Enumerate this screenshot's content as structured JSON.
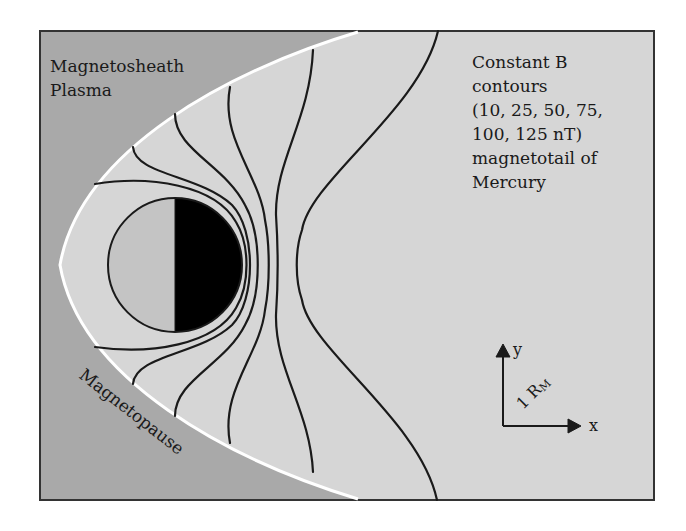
{
  "figure": {
    "regions": {
      "magnetosheath_label_line1": "Magnetosheath",
      "magnetosheath_label_line2": "Plasma",
      "magnetopause_label": "Magnetopause"
    },
    "annotation": {
      "lines": [
        "Constant B",
        "contours",
        "(10, 25, 50, 75,",
        "100, 125 nT)",
        "magnetotail of",
        "Mercury"
      ]
    },
    "axes": {
      "x_label": "x",
      "y_label": "y",
      "scale_label_main": "1 R",
      "scale_label_sub": "M"
    },
    "contour_values_nT": [
      10,
      25,
      50,
      75,
      100,
      125
    ],
    "colors": {
      "magnetosheath": "#a9a9a9",
      "magnetosphere": "#d6d6d6",
      "magnetopause_line": "#ffffff",
      "contour_line": "#1a1a1a",
      "planet_day": "#c4c4c4",
      "planet_night": "#000000",
      "frame": "#333333"
    }
  }
}
